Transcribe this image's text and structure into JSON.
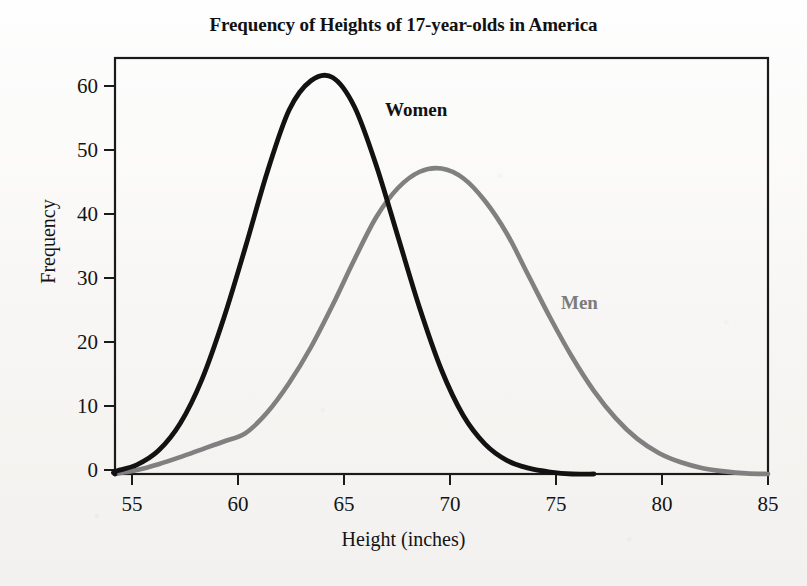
{
  "chart_data": {
    "type": "line",
    "title": "Frequency of Heights of 17-year-olds in America",
    "xlabel": "Height (inches)",
    "ylabel": "Frequency",
    "xlim": [
      55,
      85
    ],
    "ylim": [
      0,
      64
    ],
    "xticks": [
      55,
      60,
      65,
      70,
      75,
      80,
      85
    ],
    "yticks": [
      0,
      10,
      20,
      30,
      40,
      50,
      60
    ],
    "grid": false,
    "legend_position": "inline-annotation",
    "annotations": [
      {
        "text": "Women",
        "x": 67.3,
        "y": 55.5,
        "color": "#121212"
      },
      {
        "text": "Men",
        "x": 76.0,
        "y": 25.0,
        "color": "#7c7c7c"
      }
    ],
    "series": [
      {
        "name": "Women",
        "color": "#121212",
        "peak_x": 65,
        "peak_y": 61,
        "x": [
          54.0,
          55.0,
          56.0,
          57.0,
          58.0,
          59.0,
          60.0,
          61.0,
          62.0,
          63.0,
          64.0,
          65.0,
          66.0,
          67.0,
          68.0,
          69.0,
          70.0,
          71.0,
          72.0,
          73.0,
          74.0,
          75.0,
          76.0,
          77.0
        ],
        "values": [
          0.0,
          0.4,
          1.4,
          3.6,
          7.8,
          14.6,
          24.0,
          35.0,
          46.5,
          56.0,
          60.5,
          61.0,
          56.5,
          47.5,
          36.5,
          25.5,
          16.0,
          9.0,
          4.6,
          2.1,
          0.9,
          0.3,
          0.0,
          0.0
        ]
      },
      {
        "name": "Men",
        "color": "#808080",
        "peak_x": 70,
        "peak_y": 47,
        "x": [
          55.0,
          56.0,
          57.0,
          58.0,
          59.0,
          60.0,
          61.0,
          62.0,
          63.0,
          64.0,
          65.0,
          66.0,
          67.0,
          68.0,
          69.0,
          70.0,
          71.0,
          72.0,
          73.0,
          74.0,
          75.0,
          76.0,
          77.0,
          78.0,
          79.0,
          80.0,
          81.0,
          82.0,
          83.0,
          84.0,
          85.0
        ],
        "values": [
          0.0,
          0.6,
          1.5,
          2.6,
          3.8,
          5.0,
          6.3,
          9.5,
          14.0,
          19.5,
          26.0,
          33.0,
          39.5,
          44.0,
          46.5,
          47.0,
          45.5,
          42.0,
          37.0,
          30.5,
          24.0,
          18.0,
          12.8,
          8.6,
          5.4,
          3.2,
          1.8,
          0.9,
          0.4,
          0.1,
          0.0
        ]
      }
    ]
  },
  "axes": {
    "x_tick_labels": [
      "55",
      "60",
      "65",
      "70",
      "75",
      "80",
      "85"
    ],
    "y_tick_labels": [
      "0",
      "10",
      "20",
      "30",
      "40",
      "50",
      "60"
    ]
  },
  "colors": {
    "women_curve": "#121212",
    "men_curve": "#808080",
    "frame": "#1a1a1a",
    "background": "#fbfbfa"
  }
}
